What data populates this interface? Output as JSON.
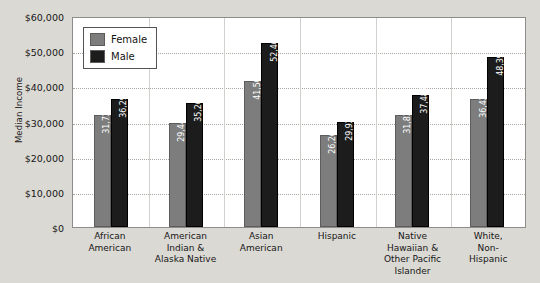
{
  "chart_data": {
    "type": "bar",
    "title": "",
    "subtitle": "",
    "xlabel": "",
    "ylabel": "Median Income",
    "ylim": [
      0,
      60000
    ],
    "ytick_labels": [
      "$60,000",
      "$50,000",
      "$40,000",
      "$30,000",
      "$20,000",
      "$10,000",
      "$0"
    ],
    "ytick_values": [
      60000,
      50000,
      40000,
      30000,
      20000,
      10000,
      0
    ],
    "grid": true,
    "grid_style": "dotted horizontal",
    "legend_position": "top-left inside plot",
    "categories": [
      "African American",
      "American Indian & Alaska Native",
      "Asian American",
      "Hispanic",
      "Native Hawaiian & Other Pacific Islander",
      "White, Non-Hispanic"
    ],
    "category_label_lines": [
      [
        "African",
        "American"
      ],
      [
        "American",
        "Indian &",
        "Alaska Native"
      ],
      [
        "Asian",
        "American"
      ],
      [
        "Hispanic"
      ],
      [
        "Native",
        "Hawaiian &",
        "Other Pacific",
        "Islander"
      ],
      [
        "White,",
        "Non-",
        "Hispanic"
      ]
    ],
    "series": [
      {
        "name": "Female",
        "color": "#7d7d7d",
        "values": [
          31724,
          29443,
          41505,
          26264,
          31837,
          36429
        ],
        "value_labels": [
          "31,724",
          "29,443",
          "41,505",
          "26,264",
          "31,837",
          "36,429"
        ]
      },
      {
        "name": "Male",
        "color": "#1c1c1c",
        "values": [
          36290,
          35267,
          52463,
          29925,
          37487,
          48395
        ],
        "value_labels": [
          "36,290",
          "35,267",
          "52,463",
          "29,925",
          "37,487",
          "48,395"
        ]
      }
    ]
  },
  "legend": {
    "entries": [
      {
        "label": "Female",
        "color": "#7d7d7d"
      },
      {
        "label": "Male",
        "color": "#1c1c1c"
      }
    ]
  },
  "colors": {
    "page_background": "#dbd9d4",
    "plot_background": "#ffffff",
    "plot_border": "#8e8c88",
    "gridline": "#a9a7a2",
    "female_bar": "#7d7d7d",
    "male_bar": "#1c1c1c",
    "text": "#161616"
  }
}
